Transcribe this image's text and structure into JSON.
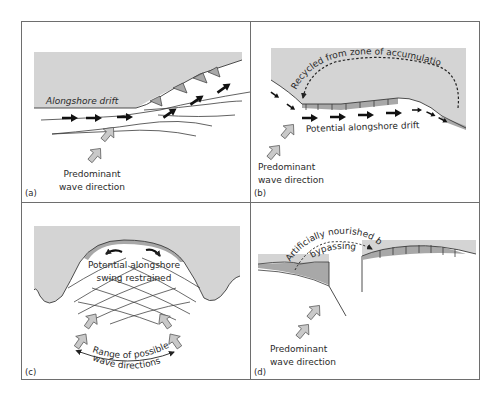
{
  "figure": {
    "colors": {
      "land": "#d4d4d4",
      "beach": "#a8a8a8",
      "line": "#3a3a3a",
      "frame": "#6e6e6e",
      "arrow_fill": "#c9c9c9",
      "drift_arrow": "#111111"
    },
    "panels": [
      {
        "id": "a",
        "panel_label": "(a)",
        "drift_label": "Alongshore drift",
        "wave_label_line1": "Predominant",
        "wave_label_line2": "wave direction"
      },
      {
        "id": "b",
        "panel_label": "(b)",
        "recycle_label": "Recycled from zone of accumulation",
        "drift_label": "Potential alongshore drift",
        "wave_label_line1": "Predominant",
        "wave_label_line2": "wave direction"
      },
      {
        "id": "c",
        "panel_label": "(c)",
        "swing_label_line1": "Potential alongshore",
        "swing_label_line2": "swing restrained",
        "range_label_line1": "Range of possible",
        "range_label_line2": "wave directions"
      },
      {
        "id": "d",
        "panel_label": "(d)",
        "nourish_label_line1": "Artificially nourished by",
        "nourish_label_line2": "bypassing",
        "wave_label_line1": "Predominant",
        "wave_label_line2": "wave direction"
      }
    ]
  }
}
